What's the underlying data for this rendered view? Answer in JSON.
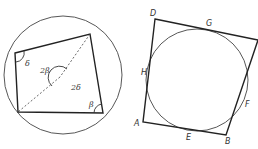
{
  "figure_left": {
    "description": "Cyclic quadrilateral inscribed in a circle with inscribed and central angles",
    "angle_labels": {
      "delta": "δ",
      "beta": "β",
      "two_beta": "2β",
      "two_delta": "2δ"
    }
  },
  "figure_right": {
    "description": "Tangential quadrilateral circumscribed about a circle",
    "vertex_labels": {
      "A": "A",
      "B": "B",
      "D": "D"
    },
    "tangent_point_labels": {
      "E": "E",
      "F": "F",
      "G": "G",
      "H": "H"
    }
  }
}
